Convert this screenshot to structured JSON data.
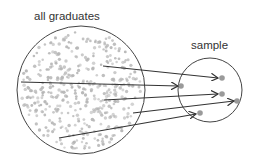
{
  "labels": {
    "population": "all graduates",
    "sample": "sample"
  },
  "colors": {
    "outline": "#444444",
    "dot": "#b5b5b5",
    "sample_dot": "#9a9a9a",
    "arrow": "#333333"
  },
  "population_circle": {
    "cx": 81,
    "cy": 90,
    "r": 64
  },
  "sample_circle": {
    "cx": 210,
    "cy": 90,
    "r": 32
  },
  "arrows": [
    {
      "from": [
        103,
        66
      ],
      "to": [
        218,
        78
      ]
    },
    {
      "from": [
        21,
        82
      ],
      "to": [
        178,
        86
      ]
    },
    {
      "from": [
        104,
        100
      ],
      "to": [
        218,
        94
      ]
    },
    {
      "from": [
        133,
        113
      ],
      "to": [
        234,
        101
      ]
    },
    {
      "from": [
        59,
        138
      ],
      "to": [
        196,
        114
      ]
    }
  ],
  "sample_points": [
    [
      222,
      78
    ],
    [
      181,
      86
    ],
    [
      222,
      94
    ],
    [
      237,
      101
    ],
    [
      200,
      113
    ]
  ]
}
